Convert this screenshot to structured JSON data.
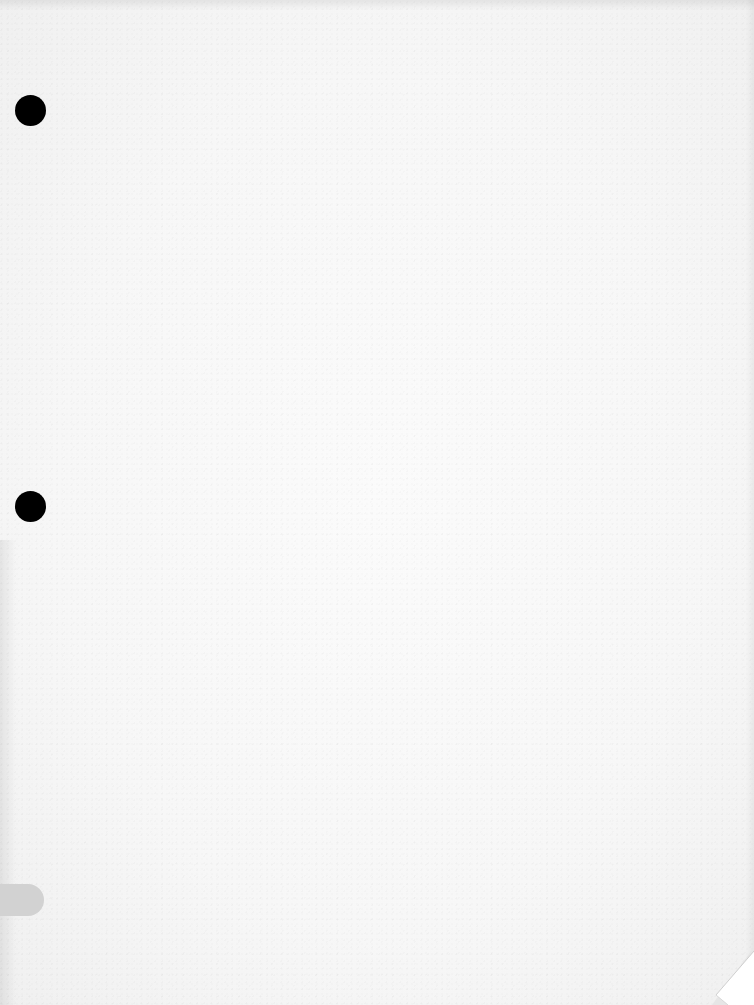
{
  "document": {
    "type": "blank scanned page",
    "text_content": "",
    "punch_holes": [
      {
        "id": "hole-1",
        "center": [
          30,
          110
        ]
      },
      {
        "id": "hole-2",
        "center": [
          30,
          506
        ]
      }
    ],
    "side_tab": {
      "color": "#d2d2d2"
    },
    "corner": "bottom-right page curl",
    "colors": {
      "paper": "#f8f8f8",
      "hole": "#000000",
      "tab": "#d2d2d2"
    }
  }
}
